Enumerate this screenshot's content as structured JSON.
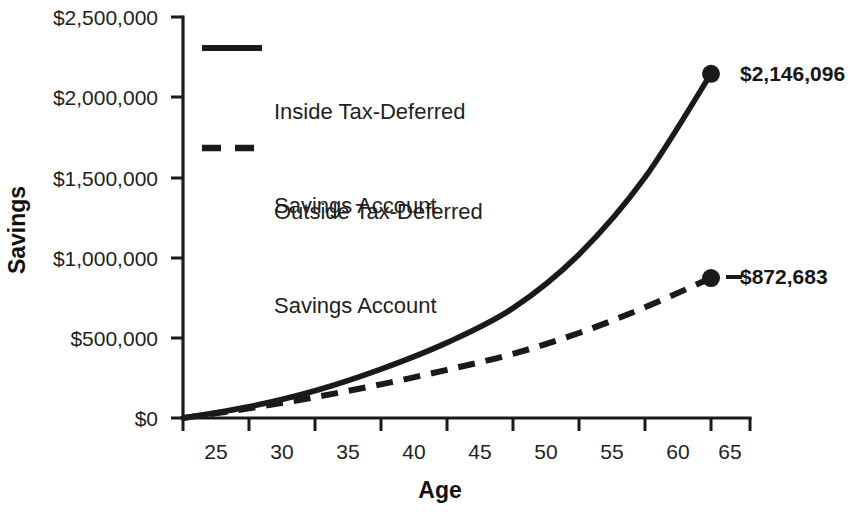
{
  "chart_data": {
    "type": "line",
    "title": "",
    "xlabel": "Age",
    "ylabel": "Savings",
    "x": [
      25,
      30,
      35,
      40,
      45,
      50,
      55,
      60,
      65
    ],
    "xlim": [
      25,
      65
    ],
    "ylim": [
      0,
      2500000
    ],
    "grid": false,
    "legend_position": "top-left inside plot",
    "xtick_labels": [
      "25",
      "30",
      "35",
      "40",
      "45",
      "50",
      "55",
      "60",
      "65"
    ],
    "ytick_labels": [
      "$0",
      "$500,000",
      "$1,000,000",
      "$1,500,000",
      "$2,000,000",
      "$2,500,000"
    ],
    "ytick_values": [
      0,
      500000,
      1000000,
      1500000,
      2000000,
      2500000
    ],
    "series": [
      {
        "name": "Inside Tax-Deferred Savings Account",
        "style": "solid",
        "color": "#1a1a1a",
        "values": [
          0,
          70000,
          170000,
          305000,
          470000,
          685000,
          1020000,
          1500000,
          2146096
        ],
        "end_label": "$2,146,096",
        "end_value": 2146096
      },
      {
        "name": "Outside Tax-Deferred Savings Account",
        "style": "dashed",
        "color": "#1a1a1a",
        "values": [
          0,
          60000,
          130000,
          210000,
          300000,
          400000,
          530000,
          690000,
          872683
        ],
        "end_label": "$872,683",
        "end_value": 872683
      }
    ]
  },
  "legend": {
    "entries": [
      {
        "line1": "Inside Tax-Deferred",
        "line2": "Savings Account",
        "style": "solid"
      },
      {
        "line1": "Outside Tax-Deferred",
        "line2": "Savings Account",
        "style": "dashed"
      }
    ]
  },
  "axes": {
    "y_title": "Savings",
    "x_title": "Age",
    "y_labels": [
      "$2,500,000",
      "$2,000,000",
      "$1,500,000",
      "$1,000,000",
      "$500,000",
      "$0"
    ],
    "x_labels": [
      "25",
      "30",
      "35",
      "40",
      "45",
      "50",
      "55",
      "60",
      "65"
    ]
  },
  "annotations": {
    "inside_end": "$2,146,096",
    "outside_end": "$872,683"
  },
  "colors": {
    "ink": "#1a1a1a",
    "background": "#ffffff"
  }
}
